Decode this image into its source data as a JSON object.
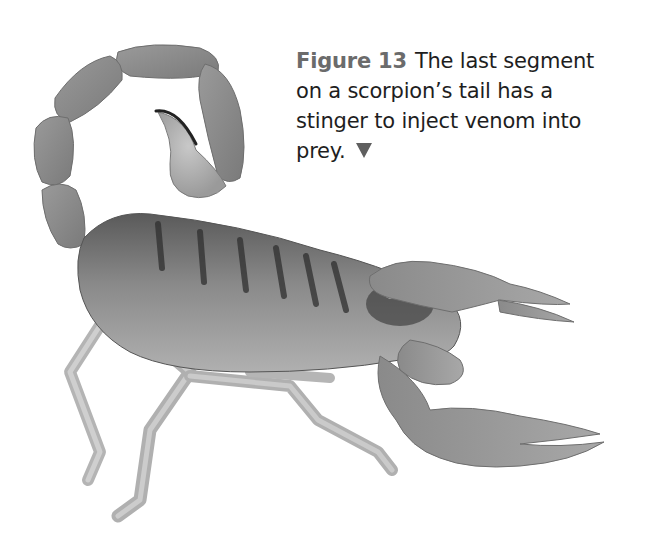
{
  "figure": {
    "label": "Figure 13",
    "caption_lines": [
      "The last segment",
      "on a scorpion’s tail has a",
      "stinger to inject venom into",
      "prey."
    ],
    "pointer_icon": "down-triangle-icon",
    "image": {
      "subject": "scorpion",
      "style": "grayscale photograph",
      "parts_visible": [
        "curled tail",
        "stinger",
        "segmented body",
        "pincers",
        "legs"
      ]
    },
    "colors": {
      "label": "#6b6b6b",
      "text": "#1e1e1e",
      "pointer": "#5f5f5f",
      "background": "#ffffff"
    }
  }
}
